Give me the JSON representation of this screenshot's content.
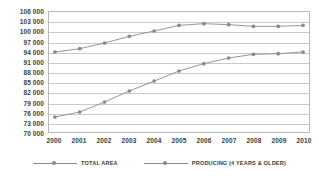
{
  "chart_data": {
    "type": "line",
    "title": "",
    "subtitle": "",
    "xlabel": "",
    "ylabel": "",
    "categories": [
      "2000",
      "2001",
      "2002",
      "2003",
      "2004",
      "2005",
      "2006",
      "2007",
      "2008",
      "2009",
      "2010"
    ],
    "x": [
      2000,
      2001,
      2002,
      2003,
      2004,
      2005,
      2006,
      2007,
      2008,
      2009,
      2010
    ],
    "series": [
      {
        "name": "TOTAL AREA",
        "values": [
          94000,
          95000,
          96700,
          98700,
          100300,
          102000,
          102500,
          102200,
          101700,
          101700,
          102000
        ],
        "color": "#8a8a8a",
        "marker": "circle"
      },
      {
        "name": "PRODUCING (4 YEARS & OLDER)",
        "values": [
          74500,
          76000,
          79000,
          82300,
          85300,
          88300,
          90500,
          92200,
          93300,
          93500,
          94000
        ],
        "color": "#8a8a8a",
        "marker": "circle"
      }
    ],
    "ylim": [
      70000,
      106000
    ],
    "ytick_step": 3000,
    "ytick_labels": [
      "106 000",
      "103 000",
      "100 000",
      "97 000",
      "94 000",
      "91 000",
      "88 000",
      "85 000",
      "82 000",
      "79 000",
      "76 000",
      "73 000",
      "70 000"
    ],
    "ytick_values": [
      106000,
      103000,
      100000,
      97000,
      94000,
      91000,
      88000,
      85000,
      82000,
      79000,
      76000,
      73000,
      70000
    ],
    "grid": true,
    "grid_axis": "y",
    "legend": {
      "position": "bottom",
      "entries": [
        "TOTAL AREA",
        "PRODUCING (4 YEARS & OLDER)"
      ]
    },
    "colors": {
      "line": "#8a8a8a",
      "marker": "#8a8a8a",
      "grid": "#c9c9c9",
      "axis_border": "#b9b9b9",
      "text": "#3d3d3d",
      "background": "#ffffff"
    }
  }
}
